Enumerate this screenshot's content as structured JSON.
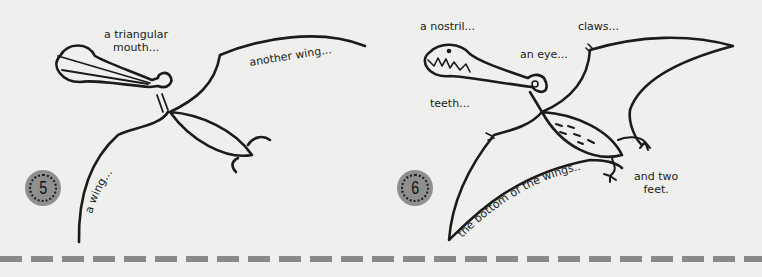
{
  "steps": [
    {
      "number": "5",
      "labels": {
        "mouth": "a triangular\nmouth...",
        "wing_top": "another wing...",
        "wing_left": "a wing..."
      }
    },
    {
      "number": "6",
      "labels": {
        "nostril": "a nostril...",
        "claws": "claws...",
        "eye": "an eye...",
        "teeth": "teeth...",
        "wing_bottom": "the bottom of the wings...",
        "feet": "and two\nfeet."
      }
    }
  ],
  "colors": {
    "background": "#efefed",
    "ink": "#1b1b1b",
    "badge": "#8f8f8f",
    "dashes": "#8a8a8a"
  }
}
